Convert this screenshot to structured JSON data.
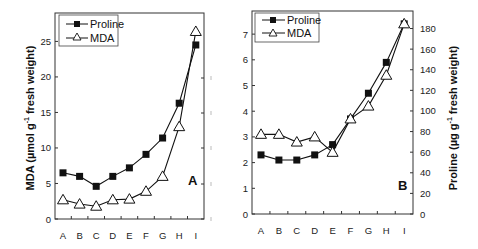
{
  "chart_data": [
    {
      "type": "line",
      "panel": "A",
      "categories": [
        "A",
        "B",
        "C",
        "D",
        "E",
        "F",
        "G",
        "H",
        "I"
      ],
      "ylabel": "MDA (µmol g-1 fresh weight)",
      "ylabel_parts": {
        "pre": "MDA (µmol g",
        "sup": "-1",
        "post": " fresh weight)"
      },
      "ylim": [
        0,
        29
      ],
      "yticks": [
        0,
        5,
        10,
        15,
        20,
        25
      ],
      "legend": [
        "Proline",
        "MDA"
      ],
      "legend_position": "upper left",
      "series": [
        {
          "name": "Proline",
          "marker": "filled-square",
          "values": [
            6.5,
            6.0,
            4.6,
            6.0,
            7.2,
            9.1,
            11.4,
            16.3,
            24.5
          ]
        },
        {
          "name": "MDA",
          "marker": "open-triangle",
          "values": [
            2.7,
            2.1,
            1.8,
            2.7,
            2.8,
            3.9,
            6.0,
            13.0,
            26.4
          ]
        }
      ],
      "grid": false
    },
    {
      "type": "line",
      "panel": "B",
      "categories": [
        "A",
        "B",
        "C",
        "D",
        "E",
        "F",
        "G",
        "H",
        "I"
      ],
      "ylabel_left": "",
      "ylim_left": [
        0,
        7.9
      ],
      "yticks_left": [
        0,
        1,
        2,
        3,
        4,
        5,
        6,
        7
      ],
      "ylabel_right": "Proline (µg g-1 fresh weight)",
      "ylabel_right_parts": {
        "pre": "Proline (µg g",
        "sup": "-1",
        "post": " fresh weight)"
      },
      "ylim_right": [
        0,
        197
      ],
      "yticks_right": [
        0,
        20,
        40,
        60,
        80,
        100,
        120,
        140,
        160,
        180
      ],
      "legend": [
        "Proline",
        "MDA"
      ],
      "legend_position": "upper left",
      "series": [
        {
          "name": "Proline",
          "marker": "filled-square",
          "axis": "left-equivalent",
          "values": [
            2.3,
            2.1,
            2.1,
            2.3,
            2.7,
            3.7,
            4.7,
            5.9,
            7.4
          ]
        },
        {
          "name": "MDA",
          "marker": "open-triangle",
          "axis": "left",
          "values": [
            3.1,
            3.1,
            2.8,
            3.0,
            2.4,
            3.7,
            4.2,
            5.4,
            7.4
          ]
        }
      ],
      "grid": false
    }
  ],
  "panelA": {
    "label": "A",
    "ytitle_pre": "MDA (µmol g",
    "ytitle_sup": "-1",
    "ytitle_post": " fresh weight)",
    "legend_proline": "Proline",
    "legend_mda": "MDA"
  },
  "panelB": {
    "label": "B",
    "ytitle_pre": "Proline (µg g",
    "ytitle_sup": "-1",
    "ytitle_post": " fresh weight)",
    "legend_proline": "Proline",
    "legend_mda": "MDA"
  }
}
